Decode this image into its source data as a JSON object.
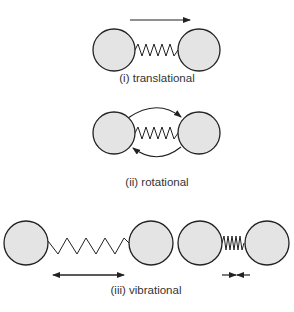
{
  "diagram": {
    "panels": [
      {
        "id": "translational",
        "label": "(i) translational",
        "motion": "linear arrow to the right above molecule"
      },
      {
        "id": "rotational",
        "label": "(ii) rotational",
        "motion": "curved arrows rotating around molecule center"
      },
      {
        "id": "vibrational",
        "label": "(iii) vibrational",
        "motion": "stretched and compressed spring states"
      }
    ]
  }
}
